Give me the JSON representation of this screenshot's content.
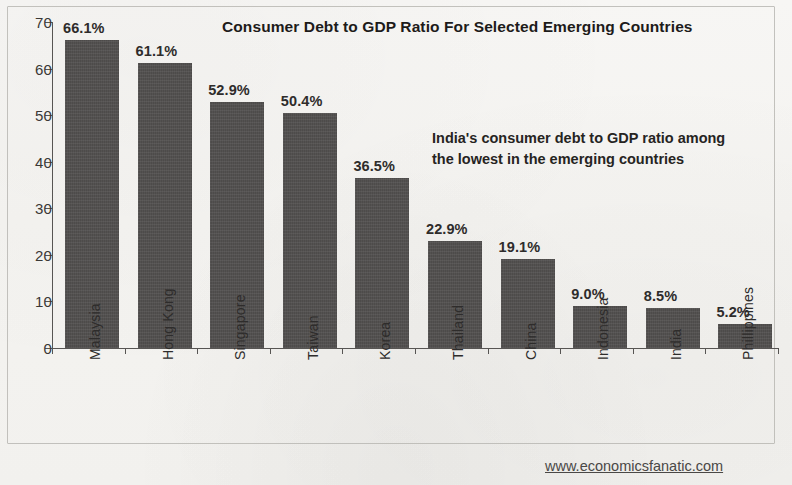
{
  "chart_data": {
    "type": "bar",
    "title": "Consumer Debt to GDP Ratio For Selected Emerging Countries",
    "xlabel": "",
    "ylabel": "",
    "ylim": [
      0,
      70
    ],
    "yticks": [
      0,
      10,
      20,
      30,
      40,
      50,
      60,
      70
    ],
    "grid": false,
    "legend": null,
    "categories": [
      "Malaysia",
      "Hong Kong",
      "Singapore",
      "Taiwan",
      "Korea",
      "Thailand",
      "China",
      "Indonesia",
      "India",
      "Phillippines"
    ],
    "values": [
      66.1,
      61.1,
      52.9,
      50.4,
      36.5,
      22.9,
      19.1,
      9.0,
      8.5,
      5.2
    ],
    "data_labels": [
      "66.1%",
      "61.1%",
      "52.9%",
      "50.4%",
      "36.5%",
      "22.9%",
      "19.1%",
      "9.0%",
      "8.5%",
      "5.2%"
    ],
    "bar_color": "#4d4b4a",
    "annotations": [
      {
        "line1": "India's consumer debt to GDP ratio among",
        "line2": "the lowest in the emerging countries"
      }
    ]
  },
  "footer": {
    "source_url": "www.economicsfanatic.com"
  }
}
